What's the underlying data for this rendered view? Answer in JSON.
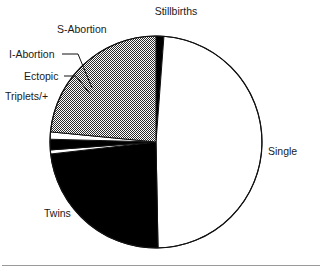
{
  "chart_data": {
    "type": "pie",
    "title": "",
    "subtitle": "",
    "xlabel": "",
    "ylabel": "",
    "legend_position": "callout-labels",
    "grid": false,
    "center": {
      "x": 156,
      "y": 142
    },
    "radius": 106,
    "start_angle_deg": -90,
    "direction": "clockwise",
    "categories": [
      "Stillbirths",
      "Single",
      "Twins",
      "Triplets/+",
      "Ectopic",
      "I-Abortion",
      "S-Abortion"
    ],
    "values": [
      1.2,
      48.5,
      23.5,
      0.6,
      1.6,
      1.1,
      23.5
    ],
    "slices": [
      {
        "label": "Stillbirths",
        "value": 1.2,
        "fill": "black",
        "color": "#000000",
        "start_deg": 0.0,
        "end_deg": 4.3,
        "label_x": 176,
        "label_y": 15,
        "label_anchor": "middle",
        "leader": false
      },
      {
        "label": "Single",
        "value": 48.5,
        "fill": "white",
        "color": "#ffffff",
        "start_deg": 4.3,
        "end_deg": 178.9,
        "label_x": 268,
        "label_y": 155,
        "label_anchor": "start",
        "leader": false
      },
      {
        "label": "Twins",
        "value": 23.5,
        "fill": "black",
        "color": "#000000",
        "start_deg": 178.9,
        "end_deg": 263.5,
        "label_x": 44,
        "label_y": 217,
        "label_anchor": "start",
        "leader": false
      },
      {
        "label": "Triplets/+",
        "value": 0.6,
        "fill": "white",
        "color": "#ffffff",
        "start_deg": 263.5,
        "end_deg": 265.7,
        "label_x": 5,
        "label_y": 100,
        "label_anchor": "start",
        "leader": false
      },
      {
        "label": "Ectopic",
        "value": 1.6,
        "fill": "black",
        "color": "#000000",
        "start_deg": 265.7,
        "end_deg": 271.5,
        "label_x": 24,
        "label_y": 80,
        "label_anchor": "start",
        "leader": true
      },
      {
        "label": "I-Abortion",
        "value": 1.1,
        "fill": "white",
        "color": "#ffffff",
        "start_deg": 271.5,
        "end_deg": 275.5,
        "label_x": 9,
        "label_y": 58,
        "label_anchor": "start",
        "leader": true
      },
      {
        "label": "S-Abortion",
        "value": 23.5,
        "fill": "hatch-gray",
        "color": "#8c8c8c",
        "start_deg": 275.5,
        "end_deg": 360.0,
        "label_x": 57,
        "label_y": 33,
        "label_anchor": "start",
        "leader": false
      }
    ],
    "annotations": [
      {
        "name": "ectopic-leader-line",
        "x1": 64,
        "y1": 76,
        "x2": 90,
        "y2": 94
      },
      {
        "name": "i-abortion-leader-line",
        "x1": 62,
        "y1": 54,
        "x2": 92,
        "y2": 88
      }
    ]
  },
  "figure": {
    "outline_color": "#111111",
    "outline_width": 1.2,
    "background": "#ffffff",
    "footer_rule_color": "#9a9a9a"
  }
}
